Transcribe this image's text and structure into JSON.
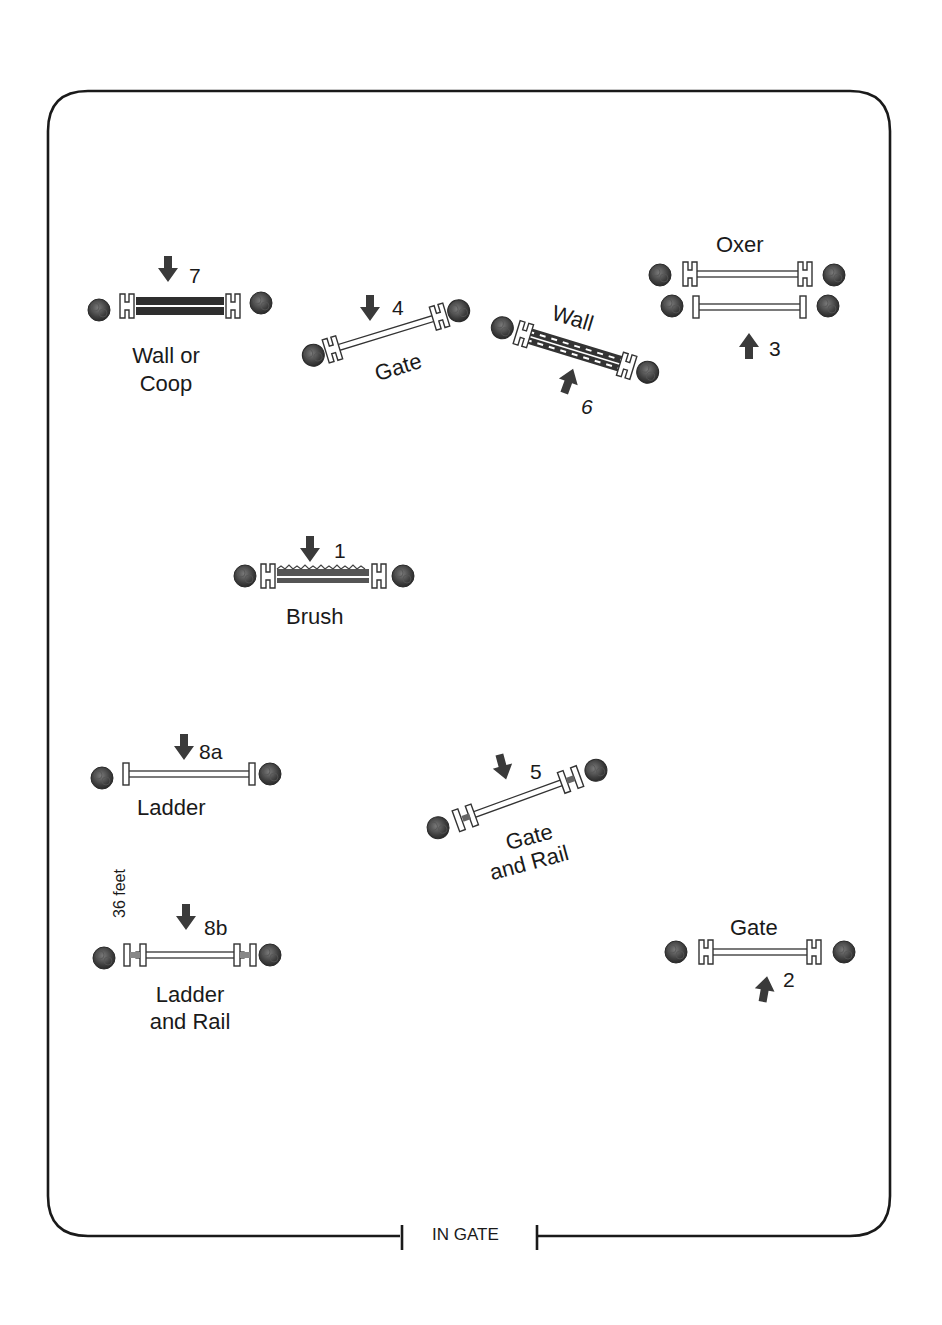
{
  "diagram": {
    "type": "horse show jumping course map",
    "arena": {
      "shape": "rounded-rectangle",
      "border_color": "#1a1a1a"
    },
    "entrance": {
      "label": "IN GATE"
    },
    "distance_note": {
      "label": "36 feet",
      "between": [
        "8a",
        "8b"
      ]
    },
    "jumps": [
      {
        "number": "1",
        "name": "Brush",
        "direction": "down"
      },
      {
        "number": "2",
        "name": "Gate",
        "direction": "up"
      },
      {
        "number": "3",
        "name": "Oxer",
        "direction": "up"
      },
      {
        "number": "4",
        "name": "Gate",
        "direction": "down"
      },
      {
        "number": "5",
        "name_line1": "Gate",
        "name_line2": "and Rail",
        "direction": "down"
      },
      {
        "number": "6",
        "name": "Wall",
        "direction": "up"
      },
      {
        "number": "7",
        "name_line1": "Wall or",
        "name_line2": "Coop",
        "direction": "down"
      },
      {
        "number": "8a",
        "name": "Ladder",
        "direction": "down"
      },
      {
        "number": "8b",
        "name_line1": "Ladder",
        "name_line2": "and Rail",
        "direction": "down"
      }
    ]
  }
}
